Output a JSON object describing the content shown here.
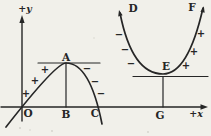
{
  "palette": {
    "paper": "#f1f0ea",
    "ink": "#262626"
  },
  "axes": {
    "x_label": "+x",
    "y_label": "+y",
    "origin_label": "O"
  },
  "max_curve": {
    "vertex_label": "A",
    "base_label": "B",
    "intercept_label": "C",
    "rising_signs": [
      "+",
      "+",
      "+"
    ],
    "falling_signs": [
      "−",
      "−",
      "−"
    ]
  },
  "min_curve": {
    "left_end_label": "D",
    "vertex_label": "E",
    "right_end_label": "F",
    "base_label": "G",
    "falling_signs": [
      "−",
      "−",
      "−"
    ],
    "rising_signs": [
      "+",
      "+",
      "+"
    ]
  }
}
